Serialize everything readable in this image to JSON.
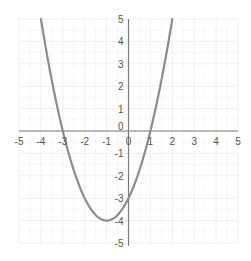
{
  "chart_data": {
    "type": "line",
    "title": "",
    "xlabel": "",
    "ylabel": "",
    "xlim": [
      -5,
      5
    ],
    "ylim": [
      -5,
      5
    ],
    "grid": true,
    "legend": null,
    "x_ticks": [
      -5,
      -4,
      -3,
      -2,
      -1,
      0,
      1,
      2,
      3,
      4,
      5
    ],
    "y_ticks": [
      -5,
      -4,
      -3,
      -2,
      -1,
      0,
      1,
      2,
      3,
      4,
      5
    ],
    "series": [
      {
        "name": "y = x^2 + 2x - 3",
        "function": "x*x + 2*x - 3",
        "x": [
          -4,
          -3.5,
          -3,
          -2.5,
          -2,
          -1.5,
          -1,
          -0.5,
          0,
          0.5,
          1,
          1.5,
          2
        ],
        "y": [
          5,
          1.25,
          0,
          -1.75,
          -3,
          -3.75,
          -4,
          -3.75,
          -3,
          -1.75,
          0,
          2.25,
          5
        ],
        "color": "#8c8c8c"
      }
    ],
    "key_points": {
      "roots": [
        -3,
        1
      ],
      "vertex": [
        -1,
        -4
      ],
      "y_intercept": -3
    }
  },
  "colors": {
    "axis": "#7a7a7a",
    "grid": "#ececec",
    "curve": "#8c8c8c",
    "label": "#555555"
  }
}
